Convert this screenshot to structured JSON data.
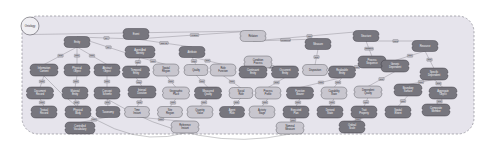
{
  "canvas": {
    "width": 492,
    "height": 144,
    "background": "#ffffff"
  },
  "container": {
    "fill": "#e6e4ec",
    "stroke": "#8e8c96",
    "stroke_style": "dashed",
    "corner_radius": 16,
    "x": 22,
    "y": 16,
    "w": 452,
    "h": 118
  },
  "palette": {
    "node_dark_fill": "#77767e",
    "node_dark_stroke": "#3a3940",
    "node_light_fill": "#c8c6ce",
    "node_light_stroke": "#5a5960",
    "root_fill": "#efeef2",
    "root_stroke": "#55545c",
    "edge_color": "#6d6c74",
    "edge_label_fill": "#bcbac2",
    "edge_label_stroke": "#5a5960"
  },
  "root_node": {
    "name": "root-node",
    "label": "Ontology",
    "shape": "circle",
    "cx": 30,
    "cy": 26,
    "r": 9
  },
  "nodes": [
    {
      "id": "n1",
      "label": "Entity",
      "x": 77,
      "y": 42,
      "w": 26,
      "h": 11,
      "tone": "dark"
    },
    {
      "id": "n2",
      "label": "Event",
      "x": 136,
      "y": 34,
      "w": 26,
      "h": 11,
      "tone": "dark"
    },
    {
      "id": "n3",
      "label": "Agent And Identity",
      "x": 140,
      "y": 52,
      "w": 30,
      "h": 12,
      "tone": "dark"
    },
    {
      "id": "n4",
      "label": "Attribute",
      "x": 192,
      "y": 52,
      "w": 26,
      "h": 11,
      "tone": "dark"
    },
    {
      "id": "n5",
      "label": "Relation",
      "x": 253,
      "y": 36,
      "w": 26,
      "h": 11,
      "tone": "light"
    },
    {
      "id": "n6",
      "label": "Condition Process",
      "x": 258,
      "y": 62,
      "w": 28,
      "h": 12,
      "tone": "light"
    },
    {
      "id": "n7",
      "label": "Measure",
      "x": 318,
      "y": 44,
      "w": 26,
      "h": 11,
      "tone": "dark"
    },
    {
      "id": "n8",
      "label": "Structure",
      "x": 366,
      "y": 36,
      "w": 26,
      "h": 11,
      "tone": "dark"
    },
    {
      "id": "n9",
      "label": "Process Sequence",
      "x": 372,
      "y": 62,
      "w": 28,
      "h": 12,
      "tone": "dark"
    },
    {
      "id": "n10",
      "label": "Resource",
      "x": 425,
      "y": 46,
      "w": 26,
      "h": 11,
      "tone": "dark"
    },
    {
      "id": "n11",
      "label": "Information Content",
      "x": 44,
      "y": 70,
      "w": 28,
      "h": 12,
      "tone": "dark"
    },
    {
      "id": "n12",
      "label": "Physical Object",
      "x": 77,
      "y": 70,
      "w": 26,
      "h": 12,
      "tone": "dark"
    },
    {
      "id": "n13",
      "label": "Abstract Object",
      "x": 107,
      "y": 70,
      "w": 26,
      "h": 12,
      "tone": "dark"
    },
    {
      "id": "n14",
      "label": "Temporal Entity",
      "x": 136,
      "y": 72,
      "w": 27,
      "h": 12,
      "tone": "dark"
    },
    {
      "id": "n15",
      "label": "Spatial Region",
      "x": 166,
      "y": 70,
      "w": 26,
      "h": 12,
      "tone": "light"
    },
    {
      "id": "n16",
      "label": "Quality",
      "x": 196,
      "y": 70,
      "w": 24,
      "h": 11,
      "tone": "light"
    },
    {
      "id": "n17",
      "label": "Role Function",
      "x": 223,
      "y": 70,
      "w": 26,
      "h": 12,
      "tone": "light"
    },
    {
      "id": "n18",
      "label": "Continuant Entity",
      "x": 253,
      "y": 72,
      "w": 28,
      "h": 12,
      "tone": "dark"
    },
    {
      "id": "n19",
      "label": "Occurrent Entity",
      "x": 285,
      "y": 72,
      "w": 27,
      "h": 12,
      "tone": "dark"
    },
    {
      "id": "n20",
      "label": "Disposition",
      "x": 315,
      "y": 70,
      "w": 25,
      "h": 11,
      "tone": "light"
    },
    {
      "id": "n21",
      "label": "Realizable Entity",
      "x": 342,
      "y": 72,
      "w": 27,
      "h": 12,
      "tone": "dark"
    },
    {
      "id": "n22",
      "label": "Generic Dependent",
      "x": 395,
      "y": 66,
      "w": 28,
      "h": 12,
      "tone": "dark"
    },
    {
      "id": "n23",
      "label": "Specific Dependent",
      "x": 434,
      "y": 74,
      "w": 28,
      "h": 12,
      "tone": "dark"
    },
    {
      "id": "n24",
      "label": "Document Record",
      "x": 40,
      "y": 93,
      "w": 27,
      "h": 12,
      "tone": "dark"
    },
    {
      "id": "n25",
      "label": "Material Entity",
      "x": 75,
      "y": 93,
      "w": 26,
      "h": 12,
      "tone": "dark"
    },
    {
      "id": "n26",
      "label": "Concept Scheme",
      "x": 107,
      "y": 93,
      "w": 26,
      "h": 12,
      "tone": "dark"
    },
    {
      "id": "n27",
      "label": "Interval Duration",
      "x": 142,
      "y": 92,
      "w": 28,
      "h": 12,
      "tone": "dark"
    },
    {
      "id": "n28",
      "label": "Geographic Place",
      "x": 176,
      "y": 93,
      "w": 27,
      "h": 12,
      "tone": "light"
    },
    {
      "id": "n29",
      "label": "Measured Quality",
      "x": 208,
      "y": 93,
      "w": 27,
      "h": 12,
      "tone": "dark"
    },
    {
      "id": "n30",
      "label": "Social Role",
      "x": 241,
      "y": 93,
      "w": 24,
      "h": 11,
      "tone": "light"
    },
    {
      "id": "n31",
      "label": "Process Profile",
      "x": 268,
      "y": 93,
      "w": 26,
      "h": 12,
      "tone": "light"
    },
    {
      "id": "n32",
      "label": "Function Bearer",
      "x": 300,
      "y": 93,
      "w": 27,
      "h": 12,
      "tone": "dark"
    },
    {
      "id": "n33",
      "label": "Capability State",
      "x": 334,
      "y": 93,
      "w": 26,
      "h": 12,
      "tone": "light"
    },
    {
      "id": "n34",
      "label": "Dependent Quality",
      "x": 368,
      "y": 92,
      "w": 28,
      "h": 12,
      "tone": "light"
    },
    {
      "id": "n35",
      "label": "Boundary Surface",
      "x": 408,
      "y": 90,
      "w": 28,
      "h": 12,
      "tone": "dark"
    },
    {
      "id": "n36",
      "label": "Aggregate Object",
      "x": 443,
      "y": 93,
      "w": 28,
      "h": 12,
      "tone": "dark"
    },
    {
      "id": "n37",
      "label": "Textual Record",
      "x": 44,
      "y": 112,
      "w": 26,
      "h": 12,
      "tone": "dark"
    },
    {
      "id": "n38",
      "label": "Physical Body",
      "x": 78,
      "y": 112,
      "w": 26,
      "h": 12,
      "tone": "dark"
    },
    {
      "id": "n39",
      "label": "Taxonomy",
      "x": 108,
      "y": 112,
      "w": 24,
      "h": 11,
      "tone": "dark"
    },
    {
      "id": "n40",
      "label": "Time Instant",
      "x": 137,
      "y": 112,
      "w": 25,
      "h": 11,
      "tone": "light"
    },
    {
      "id": "n41",
      "label": "Site Region",
      "x": 170,
      "y": 112,
      "w": 25,
      "h": 11,
      "tone": "light"
    },
    {
      "id": "n42",
      "label": "Quantity Value",
      "x": 200,
      "y": 112,
      "w": 26,
      "h": 12,
      "tone": "light"
    },
    {
      "id": "n43",
      "label": "Agent Role",
      "x": 232,
      "y": 112,
      "w": 25,
      "h": 11,
      "tone": "dark"
    },
    {
      "id": "n44",
      "label": "Activity Stage",
      "x": 262,
      "y": 112,
      "w": 26,
      "h": 12,
      "tone": "light"
    },
    {
      "id": "n45",
      "label": "Executed Plan",
      "x": 296,
      "y": 112,
      "w": 26,
      "h": 12,
      "tone": "dark"
    },
    {
      "id": "n46",
      "label": "Derived State",
      "x": 330,
      "y": 112,
      "w": 26,
      "h": 12,
      "tone": "dark"
    },
    {
      "id": "n47",
      "label": "Trait Property",
      "x": 364,
      "y": 112,
      "w": 26,
      "h": 12,
      "tone": "dark"
    },
    {
      "id": "n48",
      "label": "Spatial Extent",
      "x": 398,
      "y": 112,
      "w": 26,
      "h": 12,
      "tone": "dark"
    },
    {
      "id": "n49",
      "label": "Composite Member",
      "x": 436,
      "y": 110,
      "w": 28,
      "h": 12,
      "tone": "dark"
    },
    {
      "id": "n50",
      "label": "Controlled Vocabulary",
      "x": 80,
      "y": 128,
      "w": 30,
      "h": 12,
      "tone": "dark"
    },
    {
      "id": "n51",
      "label": "Reference Instant",
      "x": 185,
      "y": 127,
      "w": 28,
      "h": 12,
      "tone": "light"
    },
    {
      "id": "n52",
      "label": "Nominal Measure",
      "x": 290,
      "y": 128,
      "w": 28,
      "h": 12,
      "tone": "light"
    },
    {
      "id": "n53",
      "label": "Ordinal Scale",
      "x": 352,
      "y": 127,
      "w": 26,
      "h": 12,
      "tone": "dark"
    }
  ],
  "edges": [
    {
      "from": "root-node",
      "to": "n5",
      "label": "hasTop"
    },
    {
      "from": "n2",
      "to": "n1",
      "label": "isA"
    },
    {
      "from": "n2",
      "to": "n4",
      "label": "hasAttr"
    },
    {
      "from": "n2",
      "to": "n5",
      "label": "relates"
    },
    {
      "from": "n3",
      "to": "n1",
      "label": "isA"
    },
    {
      "from": "n5",
      "to": "n7",
      "label": "measures"
    },
    {
      "from": "n5",
      "to": "n8",
      "label": "part"
    },
    {
      "from": "n8",
      "to": "n9",
      "label": "hasStep"
    },
    {
      "from": "n8",
      "to": "n10",
      "label": "uses"
    },
    {
      "from": "n1",
      "to": "n11",
      "label": "sub"
    },
    {
      "from": "n1",
      "to": "n12",
      "label": "sub"
    },
    {
      "from": "n1",
      "to": "n13",
      "label": "sub"
    },
    {
      "from": "n3",
      "to": "n14",
      "label": "sub"
    },
    {
      "from": "n3",
      "to": "n15",
      "label": "sub"
    },
    {
      "from": "n4",
      "to": "n16",
      "label": "sub"
    },
    {
      "from": "n4",
      "to": "n17",
      "label": "sub"
    },
    {
      "from": "n6",
      "to": "n18",
      "label": "sub"
    },
    {
      "from": "n6",
      "to": "n19",
      "label": "sub"
    },
    {
      "from": "n7",
      "to": "n20",
      "label": "sub"
    },
    {
      "from": "n9",
      "to": "n21",
      "label": "sub"
    },
    {
      "from": "n10",
      "to": "n22",
      "label": "sub"
    },
    {
      "from": "n10",
      "to": "n23",
      "label": "sub"
    },
    {
      "from": "n11",
      "to": "n24",
      "label": "sub"
    },
    {
      "from": "n12",
      "to": "n25",
      "label": "sub"
    },
    {
      "from": "n13",
      "to": "n26",
      "label": "sub"
    },
    {
      "from": "n14",
      "to": "n27",
      "label": "sub"
    },
    {
      "from": "n15",
      "to": "n28",
      "label": "sub"
    },
    {
      "from": "n16",
      "to": "n29",
      "label": "sub"
    },
    {
      "from": "n17",
      "to": "n30",
      "label": "sub"
    },
    {
      "from": "n19",
      "to": "n31",
      "label": "sub"
    },
    {
      "from": "n21",
      "to": "n32",
      "label": "sub"
    },
    {
      "from": "n21",
      "to": "n33",
      "label": "sub"
    },
    {
      "from": "n22",
      "to": "n34",
      "label": "sub"
    },
    {
      "from": "n23",
      "to": "n35",
      "label": "sub"
    },
    {
      "from": "n23",
      "to": "n36",
      "label": "sub"
    },
    {
      "from": "n24",
      "to": "n37",
      "label": "sub"
    },
    {
      "from": "n25",
      "to": "n38",
      "label": "sub"
    },
    {
      "from": "n26",
      "to": "n39",
      "label": "sub"
    },
    {
      "from": "n27",
      "to": "n40",
      "label": "sub"
    },
    {
      "from": "n28",
      "to": "n41",
      "label": "sub"
    },
    {
      "from": "n29",
      "to": "n42",
      "label": "sub"
    },
    {
      "from": "n30",
      "to": "n43",
      "label": "sub"
    },
    {
      "from": "n31",
      "to": "n44",
      "label": "sub"
    },
    {
      "from": "n32",
      "to": "n45",
      "label": "sub"
    },
    {
      "from": "n33",
      "to": "n46",
      "label": "sub"
    },
    {
      "from": "n34",
      "to": "n47",
      "label": "sub"
    },
    {
      "from": "n35",
      "to": "n48",
      "label": "sub"
    },
    {
      "from": "n36",
      "to": "n49",
      "label": "sub"
    },
    {
      "from": "n39",
      "to": "n50",
      "label": "sub"
    },
    {
      "from": "n40",
      "to": "n51",
      "label": "sub"
    },
    {
      "from": "n45",
      "to": "n52",
      "label": "sub"
    },
    {
      "from": "n47",
      "to": "n53",
      "label": "sub"
    }
  ],
  "long_arcs": [
    {
      "from": "n11",
      "to": "n51",
      "name": "cross-link-arc-left"
    },
    {
      "from": "n26",
      "to": "n52",
      "name": "cross-link-arc-mid"
    }
  ]
}
